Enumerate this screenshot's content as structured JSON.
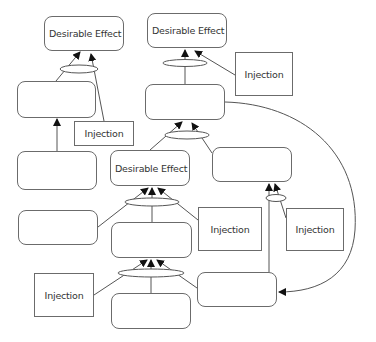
{
  "diagram": {
    "type": "future-reality-tree",
    "colors": {
      "line": "#555555",
      "box_border": "#6b6b6b",
      "text": "#333333",
      "background": "#ffffff"
    },
    "nodes": [
      {
        "id": "de1",
        "label": "Desirable Effect",
        "shape": "rounded",
        "x": 44,
        "y": 16,
        "w": 80,
        "h": 35
      },
      {
        "id": "de2",
        "label": "Desirable Effect",
        "shape": "rounded",
        "x": 147,
        "y": 13,
        "w": 80,
        "h": 35
      },
      {
        "id": "de3",
        "label": "Desirable Effect",
        "shape": "rounded",
        "x": 110,
        "y": 150,
        "w": 80,
        "h": 36
      },
      {
        "id": "l1",
        "label": "",
        "shape": "rounded",
        "x": 17,
        "y": 81,
        "w": 79,
        "h": 37
      },
      {
        "id": "l2",
        "label": "",
        "shape": "rounded",
        "x": 17,
        "y": 151,
        "w": 80,
        "h": 39
      },
      {
        "id": "l3",
        "label": "",
        "shape": "rounded",
        "x": 18,
        "y": 210,
        "w": 80,
        "h": 35
      },
      {
        "id": "r1",
        "label": "",
        "shape": "rounded",
        "x": 145,
        "y": 84,
        "w": 80,
        "h": 36
      },
      {
        "id": "r2",
        "label": "",
        "shape": "rounded",
        "x": 212,
        "y": 147,
        "w": 80,
        "h": 35
      },
      {
        "id": "m2",
        "label": "",
        "shape": "rounded",
        "x": 111,
        "y": 222,
        "w": 81,
        "h": 36
      },
      {
        "id": "m3",
        "label": "",
        "shape": "rounded",
        "x": 111,
        "y": 293,
        "w": 80,
        "h": 36
      },
      {
        "id": "r3",
        "label": "",
        "shape": "rounded",
        "x": 197,
        "y": 272,
        "w": 80,
        "h": 35
      },
      {
        "id": "inj1",
        "label": "Injection",
        "shape": "square",
        "x": 74,
        "y": 121,
        "w": 60,
        "h": 25
      },
      {
        "id": "inj2",
        "label": "Injection",
        "shape": "square",
        "x": 235,
        "y": 52,
        "w": 58,
        "h": 44
      },
      {
        "id": "inj3",
        "label": "Injection",
        "shape": "square",
        "x": 34,
        "y": 273,
        "w": 60,
        "h": 44
      },
      {
        "id": "inj4",
        "label": "Injection",
        "shape": "square",
        "x": 198,
        "y": 207,
        "w": 64,
        "h": 44
      },
      {
        "id": "inj5",
        "label": "Injection",
        "shape": "square",
        "x": 286,
        "y": 208,
        "w": 58,
        "h": 43
      }
    ],
    "ellipses": [
      {
        "id": "and1",
        "cx": 79,
        "cy": 69,
        "rx": 19,
        "ry": 4
      },
      {
        "id": "and2",
        "cx": 185,
        "cy": 63,
        "rx": 22,
        "ry": 3.5
      },
      {
        "id": "and3",
        "cx": 187,
        "cy": 135,
        "rx": 22,
        "ry": 4
      },
      {
        "id": "and4",
        "cx": 152,
        "cy": 202,
        "rx": 27,
        "ry": 4
      },
      {
        "id": "and5",
        "cx": 151,
        "cy": 273,
        "rx": 33,
        "ry": 4
      },
      {
        "id": "and6",
        "cx": 276,
        "cy": 198,
        "rx": 10,
        "ry": 3.5
      }
    ],
    "edges": [
      {
        "from": "l1",
        "to": "de1",
        "via": "and1",
        "d": "M56 81 L80 52",
        "arrow": true
      },
      {
        "from": "inj1",
        "to": "de1",
        "via": "and1",
        "d": "M104 121 L91 54",
        "arrow": true
      },
      {
        "from": "l2",
        "to": "l1",
        "d": "M57 151 L57 119",
        "arrow": true
      },
      {
        "from": "r1",
        "to": "de2",
        "via": "and2",
        "d": "M185 84 L185 50",
        "arrow": true
      },
      {
        "from": "inj2",
        "to": "de2",
        "via": "and2",
        "d": "M235 75 L195 51",
        "arrow": true
      },
      {
        "from": "de3",
        "to": "r1",
        "via": "and3",
        "d": "M150 150 L182 122",
        "arrow": true
      },
      {
        "from": "r2",
        "to": "r1",
        "via": "and3",
        "d": "M212 153 L192 123",
        "arrow": true
      },
      {
        "from": "l3",
        "to": "de3",
        "via": "and4",
        "d": "M98 227 L148 188",
        "arrow": true
      },
      {
        "from": "m2",
        "to": "de3",
        "via": "and4",
        "d": "M152 222 L152 188",
        "arrow": true
      },
      {
        "from": "inj4",
        "to": "de3",
        "via": "and4",
        "d": "M198 220 L158 188",
        "arrow": true
      },
      {
        "from": "inj3",
        "to": "m2",
        "via": "and5",
        "d": "M94 295 L147 260",
        "arrow": true
      },
      {
        "from": "m3",
        "to": "m2",
        "via": "and5",
        "d": "M151 293 L151 260",
        "arrow": true
      },
      {
        "from": "r3",
        "to": "m2",
        "via": "and5",
        "d": "M197 288 L157 260",
        "arrow": true
      },
      {
        "from": "r3",
        "to": "r2",
        "via": "and6",
        "d": "M269 272 L269 184",
        "arrow": true
      },
      {
        "from": "inj5",
        "to": "r2",
        "via": "and6",
        "d": "M286 218 L275 184",
        "arrow": true
      },
      {
        "from": "r1",
        "to": "r3",
        "d": "M225 102 C 300 104, 360 150, 355 230 C 352 275, 320 292, 279 292",
        "arrow": true
      }
    ]
  }
}
